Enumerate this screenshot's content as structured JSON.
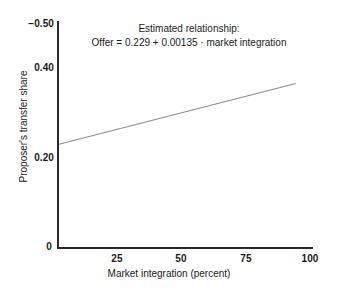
{
  "chart_data": {
    "type": "line",
    "title": "",
    "xlabel": "Market integration (percent)",
    "ylabel": "Proposer's transfer share",
    "xlim": [
      0,
      106
    ],
    "ylim": [
      0,
      0.5
    ],
    "grid": false,
    "legend": null,
    "x_ticks": [
      "25",
      "50",
      "75",
      "100"
    ],
    "x_tick_values": [
      25,
      50,
      75,
      100
    ],
    "y_ticks": [
      "−0.50",
      "0.40",
      "0.20",
      "0"
    ],
    "y_tick_values": [
      0.5,
      0.4,
      0.2,
      0
    ],
    "origin_label": "0",
    "series": [
      {
        "name": "Estimated relationship",
        "x": [
          0,
          100
        ],
        "values": [
          0.229,
          0.364
        ],
        "intercept": 0.229,
        "slope": 0.00135,
        "color": "#8c8c8c"
      }
    ],
    "annotations": [
      {
        "text": "Estimated relationship:"
      },
      {
        "text": "Offer = 0.229 + 0.00135 · market integration"
      }
    ]
  },
  "axes": {
    "line_color": "#2b2b2b"
  }
}
